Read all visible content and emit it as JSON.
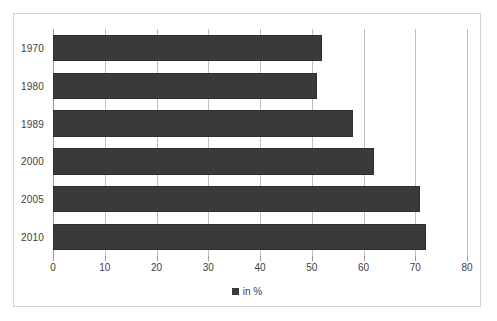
{
  "chart_data": {
    "type": "bar",
    "orientation": "horizontal",
    "title": "",
    "subtitle": "",
    "xlabel": "",
    "ylabel": "",
    "categories": [
      "1970",
      "1980",
      "1989",
      "2000",
      "2005",
      "2010"
    ],
    "values": [
      52,
      51,
      58,
      62,
      71,
      72
    ],
    "series": [
      {
        "name": "in %",
        "values": [
          52,
          51,
          58,
          62,
          71,
          72
        ],
        "color": "#3a3a3a"
      }
    ],
    "xlim": [
      0,
      80
    ],
    "xticks": [
      0,
      10,
      20,
      30,
      40,
      50,
      60,
      70,
      80
    ],
    "xtick_labels": [
      "0",
      "10",
      "20",
      "30",
      "40",
      "50",
      "60",
      "70",
      "80"
    ],
    "grid": true,
    "grid_axis": "x",
    "legend": {
      "position": "bottom",
      "entries": [
        {
          "label": "in %",
          "marker": "square",
          "color": "#3a3a3a"
        }
      ]
    },
    "annotations": [],
    "colors": {
      "bar": "#3a3a3a",
      "bar_border": "#2e2e2e",
      "gridline": "#bfbfbf",
      "axis": "#9a9a9a",
      "frame_border": "#d4d4d4",
      "text": "#404040",
      "background": "#ffffff"
    }
  }
}
